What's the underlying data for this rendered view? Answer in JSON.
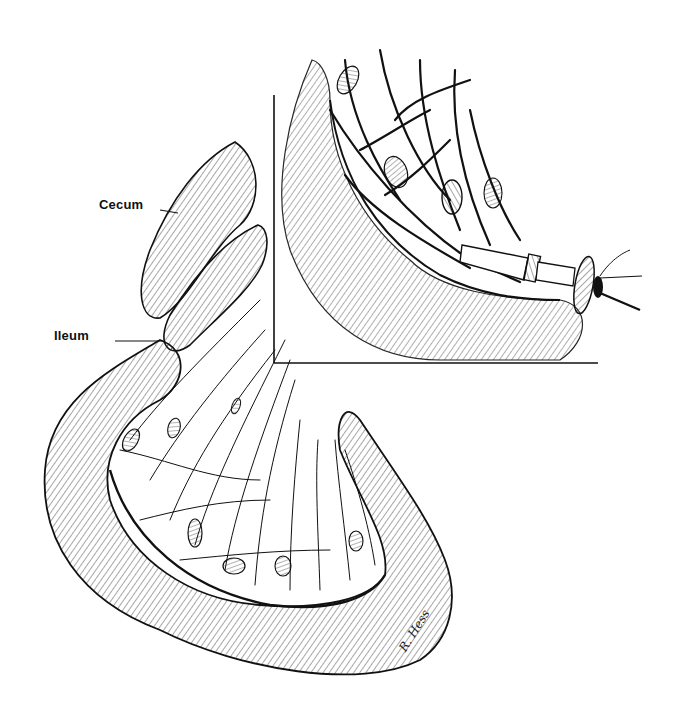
{
  "figure": {
    "type": "anatomical line illustration",
    "labels": {
      "cecum": "Cecum",
      "ileum": "Ileum"
    },
    "signature": "R. Hess",
    "colors": {
      "ink": "#111111",
      "paper": "#ffffff"
    },
    "inset": {
      "frame": "left and bottom border lines",
      "content": "bowel loop with mesenteric vessels, lymph nodes and an inserted cannula with flange"
    }
  }
}
